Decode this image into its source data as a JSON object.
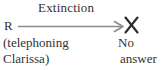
{
  "diagram": {
    "type": "contingency-diagram",
    "title_label": "Extinction",
    "antecedent": {
      "symbol": "R",
      "description_line1": "(telephoning",
      "description_line2": "Clarissa)"
    },
    "relation": {
      "label": "Extinction",
      "arrow_direction": "left-to-right",
      "arrow_style": "open-head",
      "arrow_color": "#8a8a8a"
    },
    "consequence": {
      "marker": "crossed-out-x",
      "marker_color": "#2b2b2b",
      "outcome_line1": "No",
      "outcome_line2": "answer"
    },
    "colors": {
      "background": "#ffffff",
      "text": "#33312f",
      "line": "#8a8a8a",
      "mark": "#2b2b2b"
    }
  }
}
